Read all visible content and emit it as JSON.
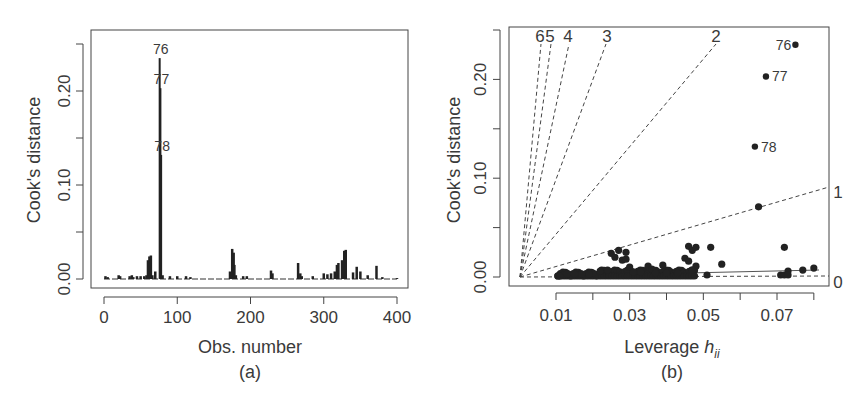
{
  "chart_data": [
    {
      "panel": "(a)",
      "type": "bar",
      "title": "",
      "xlabel": "Obs. number",
      "ylabel": "Cook's distance",
      "caption": "(a)",
      "xlim": [
        0,
        400
      ],
      "ylim": [
        0,
        0.25
      ],
      "x_ticks": [
        "0",
        "100",
        "200",
        "300",
        "400"
      ],
      "y_ticks": [
        "0.00",
        "0.10",
        "0.20"
      ],
      "y_tick_positions": [
        0.0,
        0.05,
        0.1,
        0.15,
        0.2,
        0.25
      ],
      "grid": false,
      "annotations": [
        {
          "label": "76",
          "x": 76,
          "y": 0.235
        },
        {
          "label": "77",
          "x": 77,
          "y": 0.203
        },
        {
          "label": "78",
          "x": 78,
          "y": 0.132
        }
      ],
      "x": [
        2,
        5,
        20,
        22,
        35,
        38,
        40,
        45,
        50,
        55,
        58,
        60,
        62,
        64,
        66,
        70,
        76,
        77,
        78,
        80,
        90,
        100,
        112,
        118,
        172,
        175,
        177,
        178,
        180,
        190,
        195,
        228,
        230,
        265,
        268,
        270,
        285,
        300,
        305,
        310,
        315,
        318,
        320,
        325,
        328,
        330,
        340,
        345,
        350,
        360,
        372,
        380,
        400
      ],
      "values": [
        0.003,
        0.002,
        0.004,
        0.003,
        0.003,
        0.004,
        0.002,
        0.003,
        0.003,
        0.003,
        0.004,
        0.02,
        0.024,
        0.025,
        0.004,
        0.008,
        0.235,
        0.203,
        0.132,
        0.004,
        0.003,
        0.003,
        0.003,
        0.002,
        0.008,
        0.032,
        0.028,
        0.015,
        0.004,
        0.003,
        0.003,
        0.009,
        0.006,
        0.017,
        0.006,
        0.003,
        0.003,
        0.006,
        0.005,
        0.006,
        0.008,
        0.015,
        0.017,
        0.02,
        0.03,
        0.031,
        0.007,
        0.013,
        0.008,
        0.004,
        0.014,
        0.002,
        0.001
      ]
    },
    {
      "panel": "(b)",
      "type": "scatter",
      "title": "",
      "xlabel": "Leverage h_ii",
      "xlabel_main": "Leverage ",
      "xlabel_italic": "h",
      "xlabel_sub": "ii",
      "ylabel": "Cook's distance",
      "caption": "(b)",
      "xlim": [
        0.0,
        0.08
      ],
      "ylim": [
        0,
        0.25
      ],
      "x_ticks": [
        "0.01",
        "0.03",
        "0.05",
        "0.07"
      ],
      "x_tick_positions": [
        0.01,
        0.02,
        0.03,
        0.04,
        0.05,
        0.06,
        0.07,
        0.08
      ],
      "y_ticks": [
        "0.00",
        "0.10",
        "0.20"
      ],
      "y_tick_positions": [
        0.0,
        0.05,
        0.1,
        0.15,
        0.2,
        0.25
      ],
      "grid": false,
      "contour_lines": {
        "style": "dashed",
        "labels": [
          "6",
          "5",
          "4",
          "3",
          "2",
          "1",
          "0"
        ]
      },
      "labeled_points": [
        {
          "label": "76",
          "x": 0.075,
          "y": 0.235
        },
        {
          "label": "77",
          "x": 0.067,
          "y": 0.203
        },
        {
          "label": "78",
          "x": 0.064,
          "y": 0.132
        }
      ],
      "points": [
        [
          0.065,
          0.071
        ],
        [
          0.072,
          0.03
        ],
        [
          0.046,
          0.031
        ],
        [
          0.047,
          0.027
        ],
        [
          0.048,
          0.03
        ],
        [
          0.052,
          0.03
        ],
        [
          0.055,
          0.013
        ],
        [
          0.051,
          0.002
        ],
        [
          0.071,
          0.002
        ],
        [
          0.072,
          0.002
        ],
        [
          0.073,
          0.006
        ],
        [
          0.073,
          0.002
        ],
        [
          0.077,
          0.007
        ],
        [
          0.08,
          0.009
        ],
        [
          0.045,
          0.019
        ],
        [
          0.046,
          0.016
        ],
        [
          0.048,
          0.011
        ],
        [
          0.047,
          0.007
        ],
        [
          0.039,
          0.012
        ],
        [
          0.035,
          0.011
        ],
        [
          0.03,
          0.01
        ],
        [
          0.027,
          0.027
        ],
        [
          0.025,
          0.024
        ],
        [
          0.026,
          0.02
        ],
        [
          0.028,
          0.017
        ],
        [
          0.029,
          0.025
        ],
        [
          0.029,
          0.018
        ],
        [
          0.02,
          0.004
        ],
        [
          0.015,
          0.003
        ],
        [
          0.012,
          0.002
        ],
        [
          0.011,
          0.001
        ],
        [
          0.013,
          0.003
        ],
        [
          0.017,
          0.003
        ],
        [
          0.022,
          0.006
        ],
        [
          0.024,
          0.007
        ],
        [
          0.033,
          0.005
        ],
        [
          0.036,
          0.008
        ],
        [
          0.04,
          0.004
        ],
        [
          0.043,
          0.004
        ],
        [
          0.037,
          0.004
        ],
        [
          0.031,
          0.005
        ],
        [
          0.019,
          0.003
        ]
      ]
    }
  ]
}
